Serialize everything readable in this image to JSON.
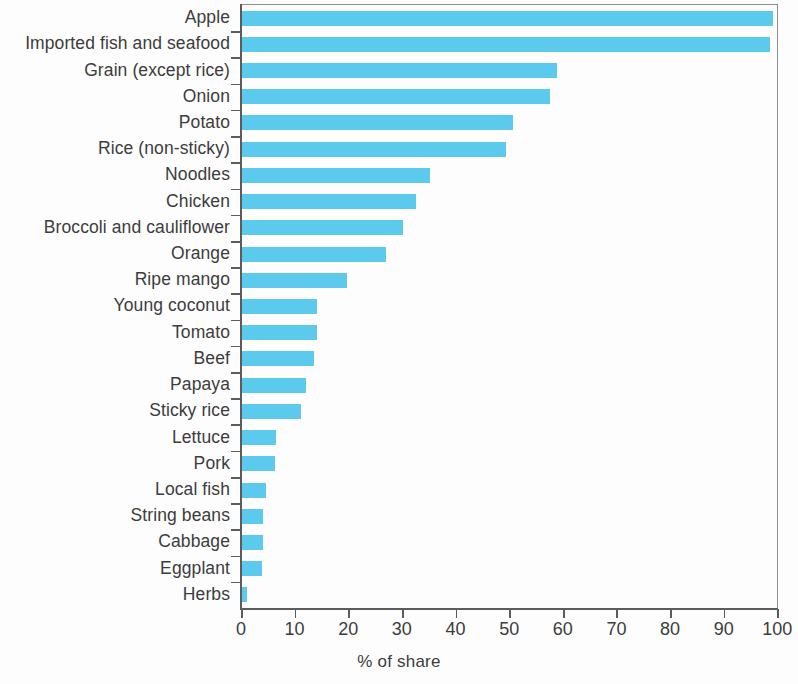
{
  "chart_data": {
    "type": "bar",
    "orientation": "horizontal",
    "title": "",
    "xlabel": "% of share",
    "ylabel": "",
    "xlim": [
      0,
      100
    ],
    "xticks": [
      0,
      10,
      20,
      30,
      40,
      50,
      60,
      70,
      80,
      90,
      100
    ],
    "xtick_labels": [
      "0",
      "10",
      "20",
      "30",
      "40",
      "50",
      "60",
      "70",
      "80",
      "90",
      "100"
    ],
    "grid": false,
    "legend": null,
    "bar_color": "#5bcaec",
    "axis_color": "#5c5c5c",
    "text_color": "#3c3c3c",
    "categories": [
      "Apple",
      "Imported fish and seafood",
      "Grain (except rice)",
      "Onion",
      "Potato",
      "Rice (non-sticky)",
      "Noodles",
      "Chicken",
      "Broccoli and cauliflower",
      "Orange",
      "Ripe mango",
      "Young coconut",
      "Tomato",
      "Beef",
      "Papaya",
      "Sticky rice",
      "Lettuce",
      "Pork",
      "Local fish",
      "String beans",
      "Cabbage",
      "Eggplant",
      "Herbs"
    ],
    "values": [
      99.0,
      98.5,
      58.8,
      57.5,
      50.5,
      49.3,
      35.0,
      32.5,
      30.0,
      26.8,
      19.5,
      14.0,
      14.0,
      13.5,
      12.0,
      11.0,
      6.4,
      6.2,
      4.4,
      3.9,
      4.0,
      3.7,
      1.0
    ]
  },
  "axis": {
    "x_title": "% of share"
  }
}
